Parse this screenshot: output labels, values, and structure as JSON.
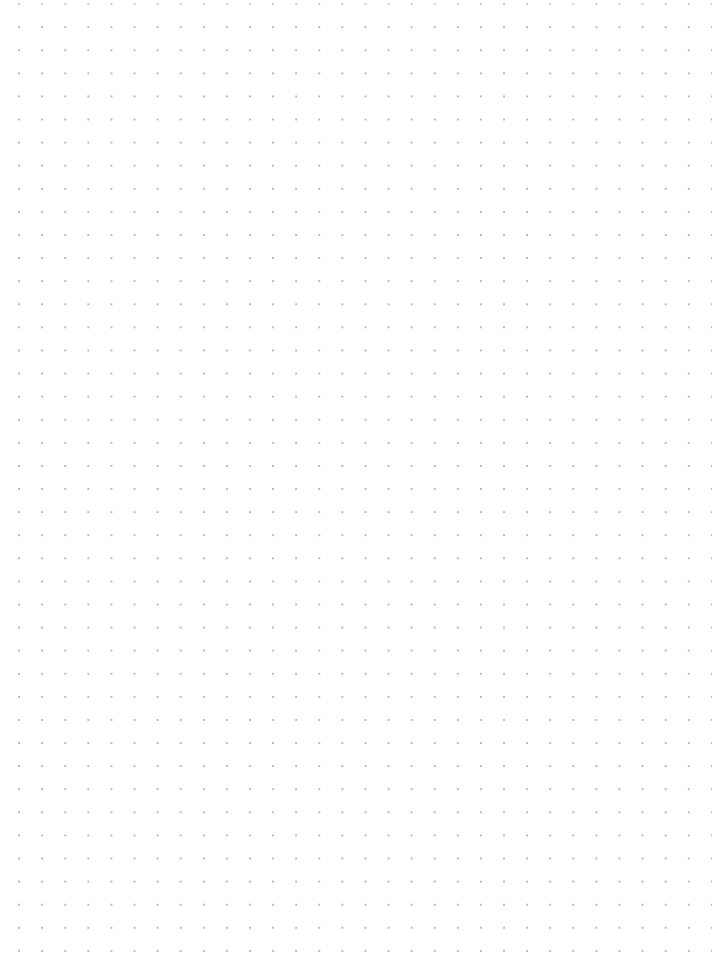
{
  "page": {
    "type": "dot-grid-paper",
    "background_color": "#ffffff",
    "dot_color": "#b8b8b8",
    "dot_spacing_px": 23.1,
    "columns": 30,
    "rows": 41
  }
}
